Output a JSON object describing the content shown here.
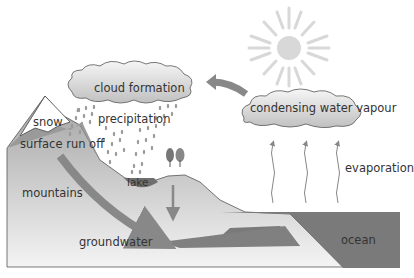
{
  "diagram": {
    "labels": {
      "cloud_formation": "cloud formation",
      "precipitation": "precipitation",
      "condensing": "condensing water vapour",
      "evaporation": "evaporation",
      "snow": "snow",
      "surface_run_off": "surface run off",
      "mountains": "mountains",
      "lake": "lake",
      "groundwater": "groundwater",
      "ocean": "ocean"
    },
    "colors": {
      "land_top": "#a8a8a8",
      "land_bottom": "#f2f2f2",
      "water": "#7a7a7a",
      "arrow": "#8a8a8a",
      "sun": "#d6d6d6",
      "cloud_top": "#f5f5f5",
      "cloud_bottom": "#c4c4c4"
    },
    "icons": [
      "sun-icon",
      "cloud-icon",
      "rain-drops",
      "tree-icon",
      "arrow-icon"
    ]
  }
}
